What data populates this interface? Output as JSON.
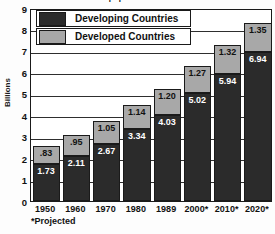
{
  "chart_data": {
    "type": "bar",
    "stacked": true,
    "title": "World population in billions",
    "xlabel": "",
    "ylabel": "Billions",
    "ylim": [
      0,
      9
    ],
    "ytick_step": 1,
    "yticks": [
      "9",
      "8",
      "7",
      "6",
      "5",
      "4",
      "3",
      "2",
      "1",
      "0"
    ],
    "grid": true,
    "legend_position": "top-left-inside",
    "categories": [
      "1950",
      "1960",
      "1970",
      "1980",
      "1989",
      "2000*",
      "2010*",
      "2020*"
    ],
    "series": [
      {
        "name": "Developing Countries",
        "color": "#2b2b2b",
        "values": [
          1.73,
          2.11,
          2.67,
          3.34,
          4.03,
          5.02,
          5.94,
          6.94
        ],
        "labels": [
          "1.73",
          "2.11",
          "2.67",
          "3.34",
          "4.03",
          "5.02",
          "5.94",
          "6.94"
        ]
      },
      {
        "name": "Developed Countries",
        "color": "#a8a8a8",
        "values": [
          0.83,
          0.95,
          1.05,
          1.14,
          1.2,
          1.27,
          1.32,
          1.35
        ],
        "labels": [
          ".83",
          ".95",
          "1.05",
          "1.14",
          "1.20",
          "1.27",
          "1.32",
          "1.35"
        ]
      }
    ],
    "totals": [
      2.56,
      3.06,
      3.72,
      4.48,
      5.23,
      6.29,
      7.26,
      8.29
    ],
    "annotations": [
      "*Projected"
    ]
  },
  "legend": {
    "items": [
      {
        "label": "Developing Countries",
        "swatch": "developing"
      },
      {
        "label": "Developed Countries",
        "swatch": "developed"
      }
    ]
  },
  "footnote": {
    "text": "*Projected"
  }
}
